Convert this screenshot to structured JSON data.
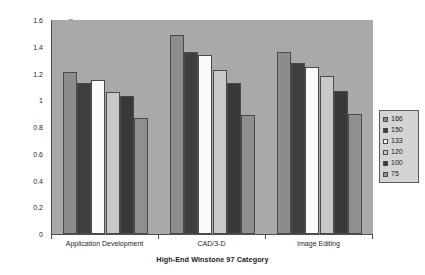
{
  "chart_data": {
    "type": "bar",
    "title": "",
    "xlabel": "High-End Winstone 97 Category",
    "ylabel": "High-End Winstone 97 Category Score",
    "categories": [
      "Application Development",
      "CAD/3-D",
      "Image Editing"
    ],
    "series": [
      {
        "name": "166",
        "values": [
          1.21,
          1.49,
          1.36
        ],
        "color": "#8c8c8c"
      },
      {
        "name": "150",
        "values": [
          1.13,
          1.36,
          1.28
        ],
        "color": "#3f3f3f"
      },
      {
        "name": "133",
        "values": [
          1.15,
          1.34,
          1.25
        ],
        "color": "#fafafa"
      },
      {
        "name": "120",
        "values": [
          1.06,
          1.23,
          1.18
        ],
        "color": "#c9c9c9"
      },
      {
        "name": "100",
        "values": [
          1.03,
          1.13,
          1.07
        ],
        "color": "#393939"
      },
      {
        "name": "75",
        "values": [
          0.87,
          0.89,
          0.9
        ],
        "color": "#8f8f8f"
      }
    ],
    "ylim": [
      0,
      1.6
    ],
    "ytick_values": [
      0,
      0.2,
      0.4,
      0.6,
      0.8,
      1,
      1.2,
      1.4,
      1.6
    ],
    "ytick_labels": [
      "0",
      "0.2",
      "0.4",
      "0.6",
      "0.8",
      "1",
      "1.2",
      "1.4",
      "1.6"
    ],
    "grid": false,
    "legend_position": "right",
    "plot_background_color": "#a9a9a9",
    "axis_color": "#4f4f4f",
    "figure_background_color": "#ffffff"
  },
  "legend": {
    "entries": [
      "166",
      "150",
      "133",
      "120",
      "100",
      "75"
    ]
  },
  "axes": {
    "y_title": "High-End Winstone 97 Category Score",
    "x_title": "High-End Winstone 97 Category"
  }
}
